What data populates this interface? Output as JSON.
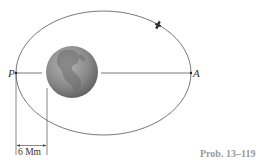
{
  "diagram": {
    "points": {
      "perigee": {
        "label": "P"
      },
      "apogee": {
        "label": "A"
      }
    },
    "dimension": {
      "label": "6 Mm"
    },
    "caption": "Prob. 13–119",
    "colors": {
      "line": "#555555",
      "earth": "#8a8a8a",
      "caption": "#9a9a9a"
    }
  }
}
